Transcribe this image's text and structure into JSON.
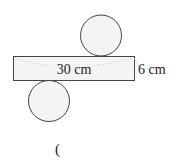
{
  "diagram": {
    "type": "cylinder-net",
    "rectangle": {
      "width_label": "30 cm",
      "height_label": "6 cm"
    },
    "circles": [
      {
        "position": "top",
        "cx": 101,
        "cy": 35,
        "r": 20.5
      },
      {
        "position": "bottom",
        "cx": 49,
        "cy": 101,
        "r": 20.5
      }
    ],
    "answer_paren": "(",
    "colors": {
      "stroke": "#444444",
      "fill": "#f4f4f4",
      "dashed": "#c8c8c8"
    }
  }
}
